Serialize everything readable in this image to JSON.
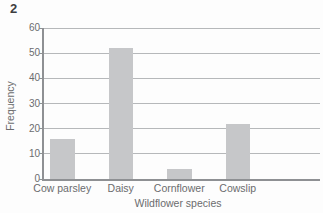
{
  "figure": {
    "question_number": "2"
  },
  "colors": {
    "bar": "#c6c7c9",
    "grid": "#b6b8ba",
    "axis": "#8e9093",
    "text": "#6b6c6e",
    "heading": "#3d3e40",
    "bg": "#fdfdfd"
  },
  "chart_data": {
    "type": "bar",
    "title": "",
    "categories": [
      "Cow parsley",
      "Daisy",
      "Cornflower",
      "Cowslip"
    ],
    "values": [
      16,
      52,
      4,
      22
    ],
    "xlabel": "Wildflower species",
    "ylabel": "Frequency",
    "ylim": [
      0,
      60
    ],
    "yticks": [
      0,
      10,
      20,
      30,
      40,
      50,
      60
    ],
    "grid": "horizontal",
    "legend": false
  }
}
